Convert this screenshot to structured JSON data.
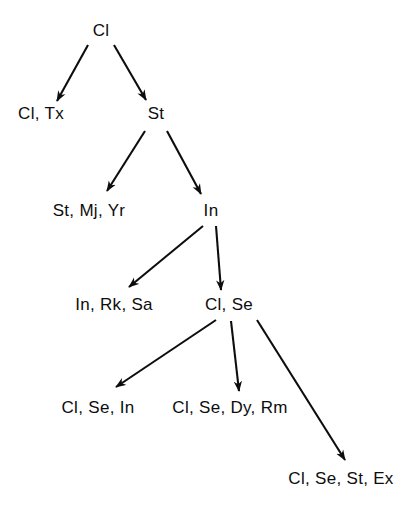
{
  "diagram": {
    "type": "tree",
    "background_color": "#ffffff",
    "stroke_color": "#0d0d0d",
    "text_color": "#0d0d0d",
    "nodes": [
      {
        "id": "cl",
        "label": "Cl",
        "x": 101,
        "y": 31,
        "level": 0
      },
      {
        "id": "cl-tx",
        "label": "Cl, Tx",
        "x": 41,
        "y": 114,
        "level": 1
      },
      {
        "id": "st",
        "label": "St",
        "x": 156,
        "y": 114,
        "level": 1
      },
      {
        "id": "st-mj-yr",
        "label": "St, Mj, Yr",
        "x": 89,
        "y": 211,
        "level": 2
      },
      {
        "id": "in",
        "label": "In",
        "x": 211,
        "y": 211,
        "level": 2
      },
      {
        "id": "in-rk-sa",
        "label": "In, Rk, Sa",
        "x": 114,
        "y": 305,
        "level": 3
      },
      {
        "id": "cl-se",
        "label": "Cl, Se",
        "x": 229,
        "y": 305,
        "level": 3
      },
      {
        "id": "cl-se-in",
        "label": "Cl, Se, In",
        "x": 98,
        "y": 408,
        "level": 4
      },
      {
        "id": "cl-se-dy-rm",
        "label": "Cl, Se, Dy, Rm",
        "x": 230,
        "y": 408,
        "level": 4
      },
      {
        "id": "cl-se-st-ex",
        "label": "Cl, Se, St, Ex",
        "x": 341,
        "y": 479,
        "level": 5
      }
    ],
    "edges": [
      {
        "id": "edge-cl-to-cl-tx",
        "from": "cl",
        "to": "cl-tx",
        "x1": 88,
        "y1": 45,
        "x2": 57,
        "y2": 101
      },
      {
        "id": "edge-cl-to-st",
        "from": "cl",
        "to": "st",
        "x1": 114,
        "y1": 45,
        "x2": 146,
        "y2": 100
      },
      {
        "id": "edge-st-to-st-mj-yr",
        "from": "st",
        "to": "st-mj-yr",
        "x1": 145,
        "y1": 131,
        "x2": 107,
        "y2": 191
      },
      {
        "id": "edge-st-to-in",
        "from": "st",
        "to": "in",
        "x1": 167,
        "y1": 131,
        "x2": 201,
        "y2": 194
      },
      {
        "id": "edge-in-to-in-rk-sa",
        "from": "in",
        "to": "in-rk-sa",
        "x1": 203,
        "y1": 226,
        "x2": 129,
        "y2": 287
      },
      {
        "id": "edge-in-to-cl-se",
        "from": "in",
        "to": "cl-se",
        "x1": 216,
        "y1": 226,
        "x2": 221,
        "y2": 290
      },
      {
        "id": "edge-cl-se-to-cl-se-in",
        "from": "cl-se",
        "to": "cl-se-in",
        "x1": 216,
        "y1": 320,
        "x2": 116,
        "y2": 387
      },
      {
        "id": "edge-cl-se-to-cl-se-dy-rm",
        "from": "cl-se",
        "to": "cl-se-dy-rm",
        "x1": 231,
        "y1": 321,
        "x2": 239,
        "y2": 391
      },
      {
        "id": "edge-cl-se-to-cl-se-st-ex",
        "from": "cl-se",
        "to": "cl-se-st-ex",
        "x1": 257,
        "y1": 320,
        "x2": 345,
        "y2": 460
      }
    ]
  }
}
